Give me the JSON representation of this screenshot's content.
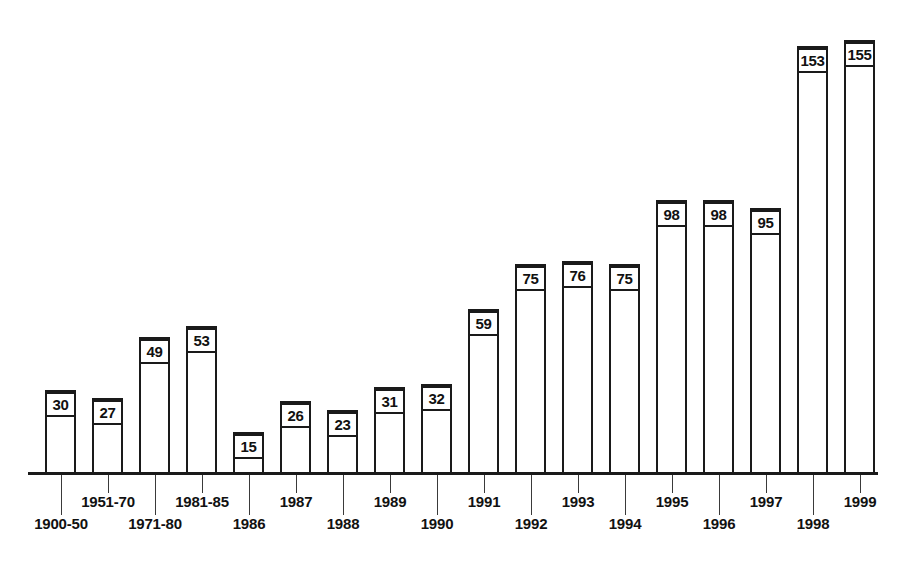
{
  "chart_data": {
    "type": "bar",
    "title": "",
    "subtitle": "",
    "xlabel": "",
    "ylabel": "",
    "ylim": [
      0,
      160
    ],
    "grid": false,
    "legend": "none",
    "axis": {
      "y_axis_visible": false,
      "x_axis_visible": true,
      "tick_labels_staggered": true
    },
    "categories": [
      "1900-50",
      "1951-70",
      "1971-80",
      "1981-85",
      "1986",
      "1987",
      "1988",
      "1989",
      "1990",
      "1991",
      "1992",
      "1993",
      "1994",
      "1995",
      "1996",
      "1997",
      "1998",
      "1999"
    ],
    "values": [
      30,
      27,
      49,
      53,
      15,
      26,
      23,
      31,
      32,
      59,
      75,
      76,
      75,
      98,
      98,
      95,
      153,
      155
    ],
    "data_labels": [
      "30",
      "27",
      "49",
      "53",
      "15",
      "26",
      "23",
      "31",
      "32",
      "59",
      "75",
      "76",
      "75",
      "98",
      "98",
      "95",
      "153",
      "155"
    ],
    "label_rows": [
      1,
      0,
      1,
      0,
      1,
      0,
      1,
      0,
      1,
      0,
      1,
      0,
      1,
      0,
      1,
      0,
      1,
      0
    ],
    "colors": {
      "bar_outline": "#1a1a1a",
      "bar_fill": "#ffffff",
      "axis": "#1a1a1a",
      "text": "#111111",
      "background": "#ffffff"
    }
  }
}
